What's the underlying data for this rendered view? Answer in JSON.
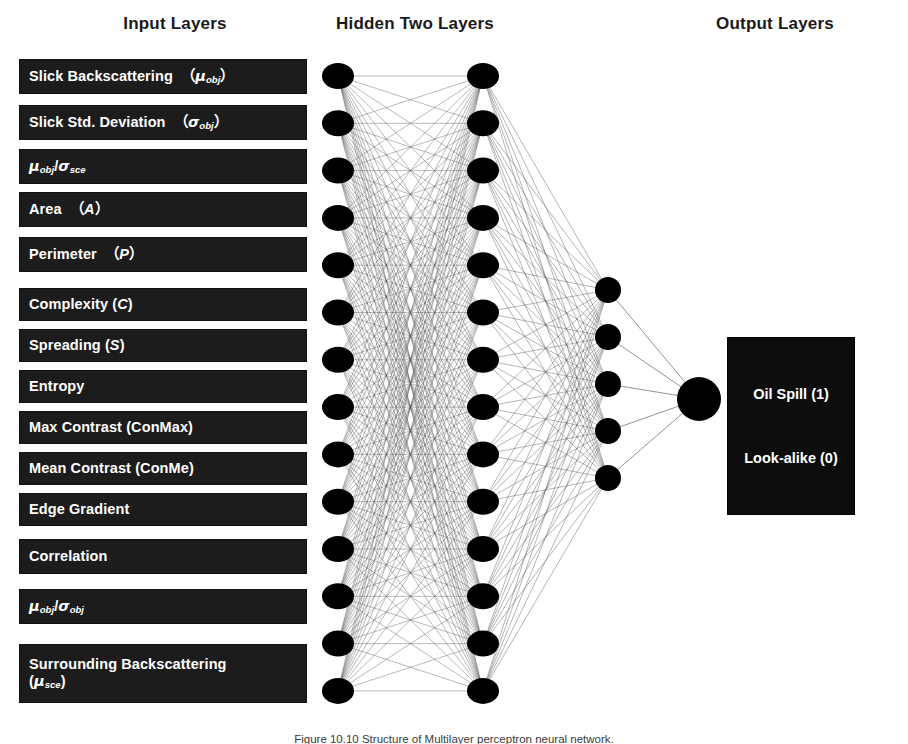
{
  "headers": {
    "input": "Input Layers",
    "hidden": "Hidden Two Layers",
    "output": "Output Layers"
  },
  "input_layer": {
    "nodes": 14,
    "features": [
      {
        "text": "Slick Backscattering （μ_obj）",
        "html": "Slick Backscattering&nbsp; （<span class=\"gk\">μ</span><sub>obj</sub>）",
        "y": 60,
        "h": 33
      },
      {
        "text": "Slick Std. Deviation （σ_obj）",
        "html": "Slick Std. Deviation&nbsp; （<span class=\"gk\">σ</span><sub>obj</sub>）",
        "y": 106,
        "h": 33
      },
      {
        "text": "μ_obj/σ_sce",
        "html": "<span class=\"gk\">μ</span><sub>obj</sub>/<span class=\"gk\">σ</span><sub>sce</sub>",
        "y": 150,
        "h": 33
      },
      {
        "text": "Area （A）",
        "html": "Area&nbsp; （<span class=\"it\">A</span>）",
        "y": 193,
        "h": 33
      },
      {
        "text": "Perimeter （P）",
        "html": "Perimeter&nbsp; （<span class=\"it\">P</span>）",
        "y": 238,
        "h": 33
      },
      {
        "text": "Complexity (C)",
        "html": "Complexity (<span class=\"it\">C</span>)",
        "y": 289,
        "h": 31
      },
      {
        "text": "Spreading (S)",
        "html": "Spreading (<span class=\"it\">S</span>)",
        "y": 330,
        "h": 31
      },
      {
        "text": "Entropy",
        "html": "Entropy",
        "y": 371,
        "h": 31
      },
      {
        "text": "Max Contrast (ConMax)",
        "html": "Max Contrast (ConMax)",
        "y": 412,
        "h": 31
      },
      {
        "text": "Mean Contrast (ConMe)",
        "html": "Mean Contrast (ConMe)",
        "y": 453,
        "h": 31
      },
      {
        "text": "Edge Gradient",
        "html": "Edge Gradient",
        "y": 494,
        "h": 31
      },
      {
        "text": "Correlation",
        "html": "Correlation",
        "y": 540,
        "h": 33
      },
      {
        "text": "μ_obj/σ_obj",
        "html": "<span class=\"gk\">μ</span><sub>obj</sub>/<span class=\"gk\">σ</span><sub>obj</sub>",
        "y": 590,
        "h": 33
      },
      {
        "text": "Surrounding Backscattering (μ_sce)",
        "html": "Surrounding Backscattering<br>(<span class=\"gk\">μ</span><sub>sce</sub>)",
        "y": 645,
        "h": 57
      }
    ]
  },
  "hidden_layer_1": {
    "nodes": 14,
    "x": 338,
    "y_top": 76,
    "y_step": 47.3,
    "rx": 16,
    "ry": 13
  },
  "hidden_layer_2": {
    "nodes": 14,
    "x": 483,
    "y_top": 76,
    "y_step": 47.3,
    "rx": 16,
    "ry": 13
  },
  "hidden_layer_3": {
    "nodes": 5,
    "x": 608,
    "y_top": 290,
    "y_step": 47,
    "rx": 13,
    "ry": 13
  },
  "output_node": {
    "nodes": 1,
    "x": 699,
    "y_top": 399,
    "rx": 22,
    "ry": 22
  },
  "output_box": {
    "lines": [
      "Oil Spill (1)",
      "Look-alike (0)"
    ]
  },
  "caption": {
    "figure_label": "Figure 10.10",
    "text": "Figure 10.10  Structure of Multilayer perceptron neural network."
  },
  "colors": {
    "box_fill": "#1c1c1c",
    "box_text": "#ffffff",
    "node_fill": "#000000",
    "edge": "#555555",
    "background": "#ffffff",
    "header_text": "#1a1a1a"
  }
}
